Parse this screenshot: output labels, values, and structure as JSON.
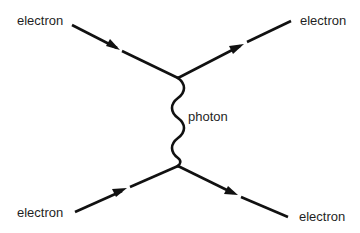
{
  "diagram": {
    "type": "feynman-diagram",
    "labels": {
      "incoming_top": "electron",
      "outgoing_top": "electron",
      "incoming_bottom": "electron",
      "outgoing_bottom": "electron",
      "propagator": "photon"
    },
    "particles": [
      {
        "id": "e-in-top",
        "name": "electron",
        "role": "incoming",
        "from": [
          72,
          25
        ],
        "to": [
          178,
          78
        ]
      },
      {
        "id": "e-out-top",
        "name": "electron",
        "role": "outgoing",
        "from": [
          178,
          78
        ],
        "to": [
          291,
          22
        ]
      },
      {
        "id": "e-in-bottom",
        "name": "electron",
        "role": "incoming",
        "from": [
          75,
          212
        ],
        "to": [
          178,
          166
        ]
      },
      {
        "id": "e-out-bottom",
        "name": "electron",
        "role": "outgoing",
        "from": [
          178,
          166
        ],
        "to": [
          288,
          216
        ]
      }
    ],
    "propagator": {
      "name": "photon",
      "style": "wavy",
      "from": [
        178,
        78
      ],
      "to": [
        178,
        166
      ]
    },
    "vertices": [
      [
        178,
        78
      ],
      [
        178,
        166
      ]
    ],
    "colors": {
      "line": "#111111",
      "text": "#1f1f1f",
      "background": "#ffffff"
    }
  }
}
